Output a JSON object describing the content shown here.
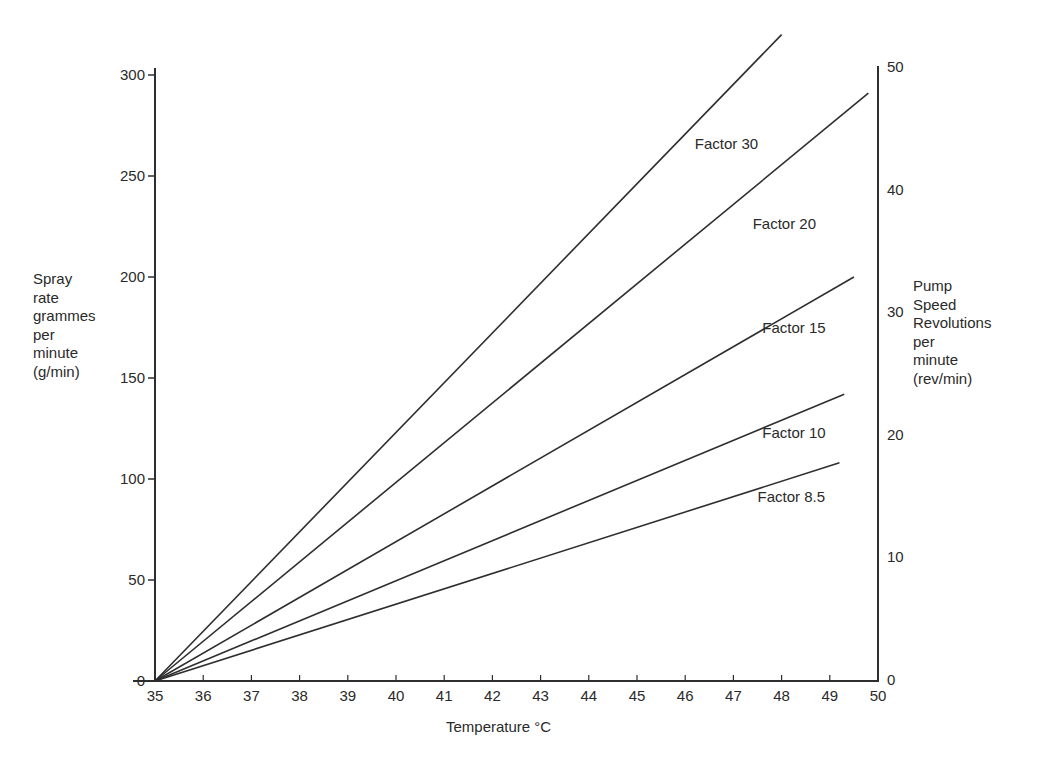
{
  "chart_data": {
    "type": "line",
    "title": "",
    "xlabel": "Temperature °C",
    "ylabel": "Spray rate grammes per minute (g/min)",
    "ylabel_lines": [
      "Spray",
      "rate",
      "grammes",
      "per",
      "minute",
      "(g/min)"
    ],
    "y2label": "Pump Speed Revolutions per minute (rev/min)",
    "y2label_lines": [
      "Pump",
      "Speed",
      "Revolutions",
      "per",
      "minute",
      "(rev/min)"
    ],
    "xlim": [
      35,
      50
    ],
    "ylim": [
      0,
      300
    ],
    "y2lim": [
      0,
      50
    ],
    "x_ticks": [
      "35",
      "36",
      "37",
      "38",
      "39",
      "40",
      "41",
      "42",
      "43",
      "44",
      "45",
      "46",
      "47",
      "48",
      "49",
      "50"
    ],
    "y_ticks": [
      "0",
      "50",
      "100",
      "150",
      "200",
      "250",
      "300"
    ],
    "y2_ticks": [
      "0",
      "10",
      "20",
      "30",
      "40",
      "50"
    ],
    "grid": false,
    "legend": "inline labels near line ends",
    "series": [
      {
        "name": "Factor 30",
        "x": [
          35,
          48.0
        ],
        "y": [
          0,
          320
        ],
        "label_pos": [
          46.2,
          266
        ]
      },
      {
        "name": "Factor 20",
        "x": [
          35,
          49.8
        ],
        "y": [
          0,
          291
        ],
        "label_pos": [
          47.4,
          226
        ]
      },
      {
        "name": "Factor 15",
        "x": [
          35,
          49.5
        ],
        "y": [
          0,
          200
        ],
        "label_pos": [
          47.6,
          175
        ]
      },
      {
        "name": "Factor 10",
        "x": [
          35,
          49.3
        ],
        "y": [
          0,
          142
        ],
        "label_pos": [
          47.6,
          123
        ]
      },
      {
        "name": "Factor 8.5",
        "x": [
          35,
          49.2
        ],
        "y": [
          0,
          108
        ],
        "label_pos": [
          47.5,
          91
        ]
      }
    ]
  }
}
